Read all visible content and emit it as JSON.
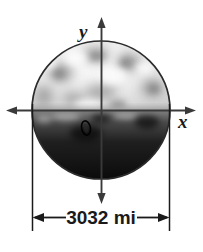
{
  "figure": {
    "background_color": "#ffffff",
    "axes": {
      "x_label": "x",
      "y_label": "y",
      "line_color": "#333333",
      "origin_label": ""
    },
    "dimension": {
      "label": "3032 mi",
      "value": 3032,
      "unit": "mi",
      "measures": "diameter",
      "line_color": "#1a1a1a"
    },
    "planet": {
      "name": "planet-sphere",
      "outline_color": "#2b2b2b",
      "upper_hemisphere_color": "#e8e8e8",
      "lower_hemisphere_color": "#1c1c1c",
      "surface_feature_label": "crater"
    }
  }
}
